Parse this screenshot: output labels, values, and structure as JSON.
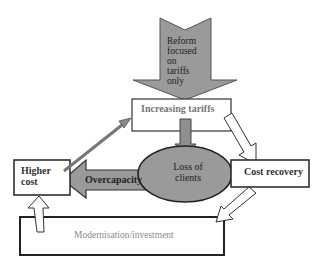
{
  "diagram": {
    "nodes": {
      "reform": {
        "label_lines": [
          "Reform",
          "focused",
          "on",
          "tariffs",
          "only"
        ],
        "shape": "down-arrow"
      },
      "increasing_tariffs": {
        "label": "Increasing tariffs",
        "shape": "rectangle"
      },
      "loss_of_clients": {
        "label_lines": [
          "Loss of",
          "clients"
        ],
        "shape": "ellipse"
      },
      "cost_recovery": {
        "label": "Cost recovery",
        "shape": "rectangle"
      },
      "higher_cost": {
        "label_lines": [
          "Higher",
          "cost"
        ],
        "shape": "rectangle"
      },
      "overcapacity": {
        "label": "Overcapacity",
        "shape": "left-arrow"
      },
      "modernisation": {
        "label": "Modernisation/investment",
        "shape": "rectangle"
      }
    },
    "edges": [
      {
        "from": "reform",
        "to": "increasing_tariffs",
        "style": "large gray block arrow"
      },
      {
        "from": "increasing_tariffs",
        "to": "loss_of_clients",
        "style": "gray block arrow"
      },
      {
        "from": "increasing_tariffs",
        "to": "cost_recovery",
        "style": "white outline arrow"
      },
      {
        "from": "loss_of_clients",
        "to": "higher_cost",
        "style": "large gray block arrow",
        "label": "Overcapacity"
      },
      {
        "from": "higher_cost",
        "to": "increasing_tariffs",
        "style": "thin gray arrow"
      },
      {
        "from": "cost_recovery",
        "to": "modernisation",
        "style": "white outline arrow"
      },
      {
        "from": "modernisation",
        "to": "higher_cost",
        "style": "white outline arrow"
      }
    ],
    "colors": {
      "fill_gray": "#9a9a9a",
      "stroke": "#222222",
      "box_fill": "#ffffff",
      "muted_text": "#8a8a8a"
    }
  }
}
